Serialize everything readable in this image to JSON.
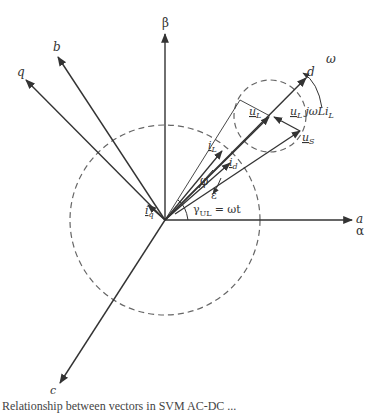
{
  "diagram": {
    "type": "vector-phasor-diagram",
    "axes": [
      {
        "id": "beta",
        "label": "β"
      },
      {
        "id": "alpha",
        "label": "α"
      },
      {
        "id": "a",
        "label": "a"
      },
      {
        "id": "b",
        "label": "b"
      },
      {
        "id": "c",
        "label": "c"
      },
      {
        "id": "q",
        "label": "q"
      },
      {
        "id": "d",
        "label": "d"
      }
    ],
    "vectors": [
      {
        "id": "iL",
        "label": "i",
        "sub": "L"
      },
      {
        "id": "id",
        "label": "i",
        "sub": "d"
      },
      {
        "id": "iq",
        "label": "i",
        "sub": "q"
      },
      {
        "id": "uL",
        "label": "u",
        "sub": "L"
      },
      {
        "id": "uS",
        "label": "u",
        "sub": "S"
      },
      {
        "id": "jwLiL",
        "label_u": "u",
        "label_u_sub": "L",
        "label_rest": "jωLi",
        "label_rest_sub": "L"
      }
    ],
    "angles": {
      "phi": "φ",
      "epsilon": "ε",
      "gamma": "γ",
      "gamma_sub": "UL",
      "gamma_eq": "= ωt"
    },
    "rotation": {
      "label": "ω"
    }
  },
  "caption": {
    "text": "Relationship between vectors in SVM AC-DC ..."
  }
}
